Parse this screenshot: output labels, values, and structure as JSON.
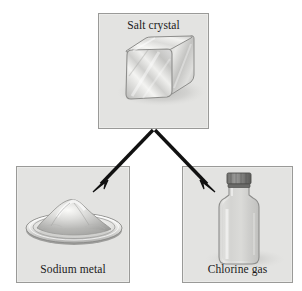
{
  "figure": {
    "background_color": "#ffffff",
    "panel_fill_color": "#e3e3e1",
    "panel_border_color": "#9a9a98",
    "arrow_color": "#111111"
  },
  "panels": {
    "salt": {
      "caption": "Salt crystal",
      "art": "salt-crystal-cube"
    },
    "sodium": {
      "caption": "Sodium metal",
      "art": "sodium-metal-dish"
    },
    "chlorine": {
      "caption": "Chlorine gas",
      "art": "chlorine-gas-bottle"
    }
  },
  "arrows": [
    {
      "name": "arrow-to-sodium",
      "from": "salt",
      "to": "sodium"
    },
    {
      "name": "arrow-to-chlorine",
      "from": "salt",
      "to": "chlorine"
    }
  ]
}
